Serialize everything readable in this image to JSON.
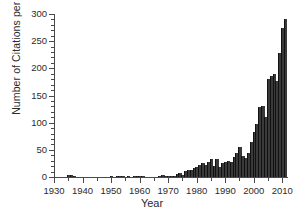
{
  "chart_data": {
    "type": "bar",
    "title": "",
    "xlabel": "Year",
    "ylabel": "Number of Citations per Year",
    "xlim": [
      1930,
      2012
    ],
    "ylim": [
      0,
      300
    ],
    "grid": false,
    "legend": null,
    "bar_color": "#3a3a3a",
    "axis_color": "#4a4a4a",
    "x_ticks": [
      1930,
      1940,
      1950,
      1960,
      1970,
      1980,
      1990,
      2000,
      2010
    ],
    "x_tick_labels": [
      "1930",
      "1940",
      "1950",
      "1960",
      "1970",
      "1980",
      "1990",
      "2000",
      "2010"
    ],
    "x_minor_interval": 5,
    "y_ticks": [
      0,
      50,
      100,
      150,
      200,
      250,
      300
    ],
    "y_tick_labels": [
      "0",
      "50",
      "100",
      "150",
      "200",
      "250",
      "300"
    ],
    "y_minor_interval": 10,
    "categories": [
      1933,
      1934,
      1935,
      1936,
      1937,
      1938,
      1939,
      1940,
      1941,
      1942,
      1943,
      1944,
      1945,
      1946,
      1947,
      1948,
      1949,
      1950,
      1951,
      1952,
      1953,
      1954,
      1955,
      1956,
      1957,
      1958,
      1959,
      1960,
      1961,
      1962,
      1963,
      1964,
      1965,
      1966,
      1967,
      1968,
      1969,
      1970,
      1971,
      1972,
      1973,
      1974,
      1975,
      1976,
      1977,
      1978,
      1979,
      1980,
      1981,
      1982,
      1983,
      1984,
      1985,
      1986,
      1987,
      1988,
      1989,
      1990,
      1991,
      1992,
      1993,
      1994,
      1995,
      1996,
      1997,
      1998,
      1999,
      2000,
      2001,
      2002,
      2003,
      2004,
      2005,
      2006,
      2007,
      2008,
      2009,
      2010,
      2011
    ],
    "values": [
      0,
      0,
      3,
      3,
      1,
      0,
      0,
      0,
      0,
      0,
      0,
      0,
      0,
      0,
      0,
      0,
      0,
      1,
      0,
      2,
      2,
      1,
      0,
      2,
      0,
      2,
      1,
      1,
      1,
      0,
      0,
      0,
      0,
      0,
      2,
      3,
      2,
      2,
      2,
      1,
      5,
      7,
      4,
      11,
      13,
      12,
      17,
      19,
      22,
      25,
      22,
      28,
      33,
      21,
      33,
      19,
      26,
      27,
      29,
      28,
      36,
      44,
      55,
      39,
      35,
      44,
      64,
      82,
      98,
      128,
      130,
      110,
      180,
      186,
      190,
      177,
      228,
      275,
      291
    ],
    "series_name": "Citations per Year"
  }
}
